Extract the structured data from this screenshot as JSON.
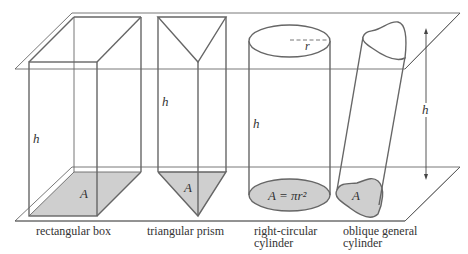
{
  "diagram": {
    "type": "prisms-and-cylinders-volume",
    "colors": {
      "stroke": "#666666",
      "base_fill": "#cfcfcf",
      "plane_stroke": "#555555",
      "text": "#333333"
    },
    "shapes": [
      {
        "id": "rectangular-box",
        "caption": [
          "rectangular box"
        ],
        "height_label": "h",
        "base_label": "A"
      },
      {
        "id": "triangular-prism",
        "caption": [
          "triangular prism"
        ],
        "height_label": "h",
        "base_label": "A"
      },
      {
        "id": "right-circular-cylinder",
        "caption": [
          "right-circular",
          "cylinder"
        ],
        "height_label": "h",
        "base_label": "A = πr²",
        "radius_label": "r"
      },
      {
        "id": "oblique-general-cylinder",
        "caption": [
          "oblique general",
          "cylinder"
        ],
        "base_label": "A"
      }
    ],
    "height_arrow_label": "h"
  }
}
